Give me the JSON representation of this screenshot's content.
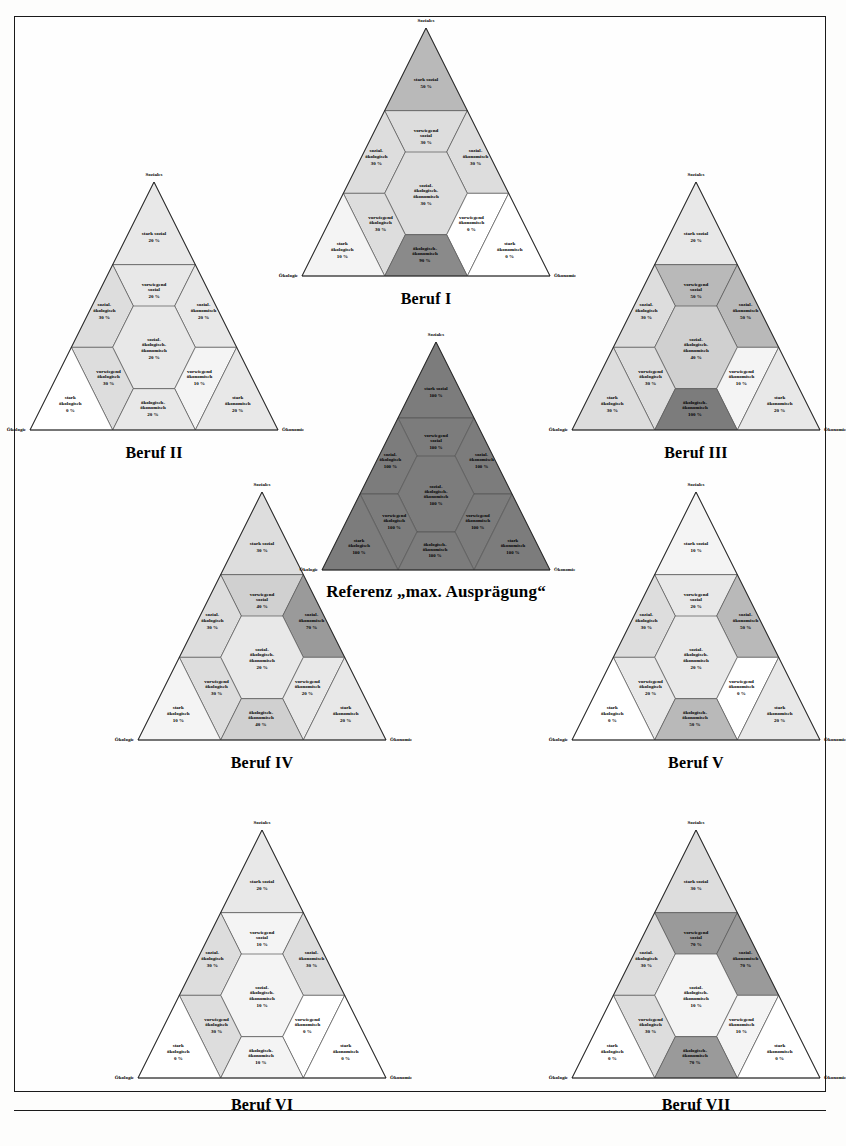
{
  "figure": {
    "corner_labels": {
      "top": "Soziales",
      "left": "Ökologie",
      "right": "Ökonomie"
    },
    "cell_names": {
      "stark_sozial": "stark sozial",
      "vorwiegend_sozial": "vorwiegend sozial",
      "sozial_oekologisch": "sozial-ökologisch",
      "sozial_oekonomisch": "sozial-ökonomisch",
      "zentrum": "sozial-ökologisch-ökonomisch",
      "vorwiegend_oekologisch": "vorwiegend ökologisch",
      "vorwiegend_oekonomisch": "vorwiegend ökonomisch",
      "oekologisch_oekonomisch": "ökologisch-ökonomisch",
      "stark_oekologisch": "stark ökologisch",
      "stark_oekonomisch": "stark ökonomisch"
    },
    "unit": "%"
  },
  "chart_data": {
    "type": "table",
    "categories": [
      "stark sozial",
      "vorwiegend sozial",
      "sozial-ökologisch",
      "sozial-ökonomisch",
      "sozial-ökologisch-ökonomisch",
      "vorwiegend ökologisch",
      "vorwiegend ökonomisch",
      "ökologisch-ökonomisch",
      "stark ökologisch",
      "stark ökonomisch"
    ],
    "series": [
      {
        "name": "Beruf I",
        "values": [
          50,
          30,
          30,
          30,
          30,
          30,
          0,
          90,
          10,
          0
        ]
      },
      {
        "name": "Beruf II",
        "values": [
          20,
          20,
          30,
          20,
          20,
          30,
          10,
          20,
          0,
          20
        ]
      },
      {
        "name": "Beruf III",
        "values": [
          20,
          50,
          30,
          50,
          40,
          30,
          10,
          100,
          30,
          20
        ]
      },
      {
        "name": "Beruf IV",
        "values": [
          30,
          40,
          30,
          70,
          20,
          30,
          20,
          40,
          10,
          20
        ]
      },
      {
        "name": "Beruf V",
        "values": [
          10,
          20,
          30,
          50,
          20,
          20,
          0,
          50,
          0,
          20
        ]
      },
      {
        "name": "Beruf VI",
        "values": [
          20,
          10,
          30,
          30,
          10,
          30,
          0,
          10,
          0,
          0
        ]
      },
      {
        "name": "Beruf VII",
        "values": [
          30,
          70,
          30,
          70,
          10,
          30,
          10,
          70,
          0,
          0
        ]
      },
      {
        "name": "Referenz „max. Ausprägung“",
        "values": [
          100,
          100,
          100,
          100,
          100,
          100,
          100,
          100,
          100,
          100
        ]
      }
    ],
    "xlabel": "Nachhaltigkeitsfeld",
    "ylabel": "Ausprägung (%)",
    "ylim": [
      0,
      100
    ],
    "legend": "none",
    "grid": false
  },
  "charts": [
    {
      "id": "beruf-1",
      "caption": "Beruf I",
      "cells": {
        "stark_sozial": "50 %",
        "vorwiegend_sozial": "30 %",
        "sozial_oekologisch": "30 %",
        "sozial_oekonomisch": "30 %",
        "zentrum": "30 %",
        "vorwiegend_oekologisch": "30 %",
        "vorwiegend_oekonomisch": "0 %",
        "oekologisch_oekonomisch": "90 %",
        "stark_oekologisch": "10 %",
        "stark_oekonomisch": "0 %"
      }
    },
    {
      "id": "beruf-2",
      "caption": "Beruf II",
      "cells": {
        "stark_sozial": "20 %",
        "vorwiegend_sozial": "20 %",
        "sozial_oekologisch": "30 %",
        "sozial_oekonomisch": "20 %",
        "zentrum": "20 %",
        "vorwiegend_oekologisch": "30 %",
        "vorwiegend_oekonomisch": "10 %",
        "oekologisch_oekonomisch": "20 %",
        "stark_oekologisch": "0 %",
        "stark_oekonomisch": "20 %"
      }
    },
    {
      "id": "beruf-3",
      "caption": "Beruf III",
      "cells": {
        "stark_sozial": "20 %",
        "vorwiegend_sozial": "50 %",
        "sozial_oekologisch": "30 %",
        "sozial_oekonomisch": "50 %",
        "zentrum": "40 %",
        "vorwiegend_oekologisch": "30 %",
        "vorwiegend_oekonomisch": "10 %",
        "oekologisch_oekonomisch": "100 %",
        "stark_oekologisch": "30 %",
        "stark_oekonomisch": "20 %"
      }
    },
    {
      "id": "beruf-4",
      "caption": "Beruf IV",
      "cells": {
        "stark_sozial": "30 %",
        "vorwiegend_sozial": "40 %",
        "sozial_oekologisch": "30 %",
        "sozial_oekonomisch": "70 %",
        "zentrum": "20 %",
        "vorwiegend_oekologisch": "30 %",
        "vorwiegend_oekonomisch": "20 %",
        "oekologisch_oekonomisch": "40 %",
        "stark_oekologisch": "10 %",
        "stark_oekonomisch": "20 %"
      }
    },
    {
      "id": "beruf-5",
      "caption": "Beruf V",
      "cells": {
        "stark_sozial": "10 %",
        "vorwiegend_sozial": "20 %",
        "sozial_oekologisch": "30 %",
        "sozial_oekonomisch": "50 %",
        "zentrum": "20 %",
        "vorwiegend_oekologisch": "20 %",
        "vorwiegend_oekonomisch": "0 %",
        "oekologisch_oekonomisch": "50 %",
        "stark_oekologisch": "0 %",
        "stark_oekonomisch": "20 %"
      }
    },
    {
      "id": "beruf-6",
      "caption": "Beruf VI",
      "cells": {
        "stark_sozial": "20 %",
        "vorwiegend_sozial": "10 %",
        "sozial_oekologisch": "30 %",
        "sozial_oekonomisch": "30 %",
        "zentrum": "10 %",
        "vorwiegend_oekologisch": "30 %",
        "vorwiegend_oekonomisch": "0 %",
        "oekologisch_oekonomisch": "10 %",
        "stark_oekologisch": "0 %",
        "stark_oekonomisch": "0 %"
      }
    },
    {
      "id": "beruf-7",
      "caption": "Beruf VII",
      "cells": {
        "stark_sozial": "30 %",
        "vorwiegend_sozial": "70 %",
        "sozial_oekologisch": "30 %",
        "sozial_oekonomisch": "70 %",
        "zentrum": "10 %",
        "vorwiegend_oekologisch": "30 %",
        "vorwiegend_oekonomisch": "10 %",
        "oekologisch_oekonomisch": "70 %",
        "stark_oekologisch": "0 %",
        "stark_oekonomisch": "0 %"
      }
    },
    {
      "id": "referenz",
      "caption": "Referenz „max. Ausprägung“",
      "cells": {
        "stark_sozial": "100 %",
        "vorwiegend_sozial": "100 %",
        "sozial_oekologisch": "100 %",
        "sozial_oekonomisch": "100 %",
        "zentrum": "100 %",
        "vorwiegend_oekologisch": "100 %",
        "vorwiegend_oekonomisch": "100 %",
        "oekologisch_oekonomisch": "100 %",
        "stark_oekologisch": "100 %",
        "stark_oekonomisch": "100 %"
      }
    }
  ],
  "palette": {
    "ink": "#1a1a1a",
    "outline": "#555555",
    "shade_0": "#ffffff",
    "shade_10": "#f4f4f4",
    "shade_20": "#e8e8e8",
    "shade_30": "#dddddd",
    "shade_40": "#d0d0d0",
    "shade_50": "#b9b9b9",
    "shade_70": "#9a9a9a",
    "shade_90": "#8a8a8a",
    "shade_100": "#7c7c7c"
  }
}
